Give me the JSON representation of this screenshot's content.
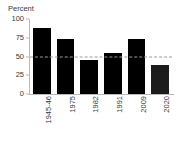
{
  "chart_data": {
    "type": "bar",
    "title": "",
    "subtitle": "",
    "xlabel": "",
    "ylabel": "Percent",
    "categories": [
      "1945-46",
      "1975",
      "1982",
      "1991",
      "2009",
      "2020"
    ],
    "values": [
      88,
      74,
      45,
      55,
      74,
      39
    ],
    "ylim": [
      0,
      100
    ],
    "yticks": [
      100,
      75,
      50,
      25,
      0
    ],
    "ytick_labels": [
      "100",
      "75",
      "50",
      "25",
      "0"
    ],
    "grid": false,
    "legend": null,
    "legend_position": "none",
    "bar_colors": [
      "#000000",
      "#000000",
      "#000000",
      "#000000",
      "#000000",
      "#1c1c1c"
    ],
    "annotations": [
      {
        "type": "reference-line",
        "orientation": "horizontal",
        "value": 50,
        "style": "dashed",
        "color": "#9a9a9a",
        "label": ""
      }
    ],
    "axis_color": "#b9b9b9",
    "text_color": "#3a3a3a",
    "background": "#ffffff"
  }
}
